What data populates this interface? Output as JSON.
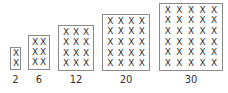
{
  "diagram": {
    "title": "",
    "arrays": [
      {
        "label": "2",
        "rows": 2,
        "cols": 1,
        "mark": "X",
        "box": {
          "x": 10,
          "y": 47,
          "w": 11,
          "h": 23
        }
      },
      {
        "label": "6",
        "rows": 3,
        "cols": 2,
        "mark": "X",
        "box": {
          "x": 28,
          "y": 35,
          "w": 22,
          "h": 35
        }
      },
      {
        "label": "12",
        "rows": 4,
        "cols": 3,
        "mark": "X",
        "box": {
          "x": 58,
          "y": 25,
          "w": 36,
          "h": 46
        }
      },
      {
        "label": "20",
        "rows": 5,
        "cols": 4,
        "mark": "X",
        "box": {
          "x": 102,
          "y": 14,
          "w": 48,
          "h": 57
        }
      },
      {
        "label": "30",
        "rows": 6,
        "cols": 5,
        "mark": "X",
        "box": {
          "x": 159,
          "y": 3,
          "w": 64,
          "h": 68
        }
      }
    ]
  }
}
